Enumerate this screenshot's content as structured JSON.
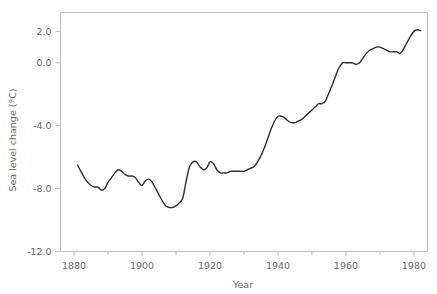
{
  "chart_data": {
    "type": "line",
    "title": "",
    "xlabel": "Year",
    "ylabel": "Sea level change (°C)",
    "xlim": [
      1876,
      1984
    ],
    "ylim": [
      -12.0,
      3.2
    ],
    "grid": false,
    "legend": null,
    "x_ticks": [
      1880,
      1900,
      1920,
      1940,
      1960,
      1980
    ],
    "x_tick_labels": [
      "1880",
      "1900",
      "1920",
      "1940",
      "1960",
      "1980"
    ],
    "x_minor_ticks": [
      1890,
      1910,
      1930,
      1950,
      1970
    ],
    "y_ticks": [
      2.0,
      0.0,
      -4.0,
      -8.0,
      -12.0
    ],
    "y_tick_labels": [
      "2.0",
      "0.0",
      "-4.0",
      "-8.0",
      "-12.0"
    ],
    "line_color": "#2e2e2e",
    "frame_color": "#bdbdbd",
    "series": [
      {
        "name": "Sea level change",
        "x": [
          1881,
          1882,
          1883,
          1884,
          1885,
          1886,
          1887,
          1888,
          1889,
          1890,
          1891,
          1892,
          1893,
          1894,
          1895,
          1896,
          1897,
          1898,
          1899,
          1900,
          1901,
          1902,
          1903,
          1904,
          1905,
          1906,
          1907,
          1908,
          1909,
          1910,
          1911,
          1912,
          1913,
          1914,
          1915,
          1916,
          1917,
          1918,
          1919,
          1920,
          1921,
          1922,
          1923,
          1924,
          1925,
          1926,
          1927,
          1928,
          1929,
          1930,
          1931,
          1932,
          1933,
          1934,
          1935,
          1936,
          1937,
          1938,
          1939,
          1940,
          1941,
          1942,
          1943,
          1944,
          1945,
          1946,
          1947,
          1948,
          1949,
          1950,
          1951,
          1952,
          1953,
          1954,
          1955,
          1956,
          1957,
          1958,
          1959,
          1960,
          1961,
          1962,
          1963,
          1964,
          1965,
          1966,
          1967,
          1968,
          1969,
          1970,
          1971,
          1972,
          1973,
          1974,
          1975,
          1976,
          1977,
          1978,
          1979,
          1980,
          1981,
          1982
        ],
        "y": [
          -6.5,
          -6.9,
          -7.3,
          -7.6,
          -7.8,
          -7.9,
          -7.9,
          -8.1,
          -8.0,
          -7.6,
          -7.3,
          -7.0,
          -6.8,
          -6.9,
          -7.1,
          -7.2,
          -7.2,
          -7.3,
          -7.6,
          -7.8,
          -7.5,
          -7.4,
          -7.6,
          -8.0,
          -8.4,
          -8.8,
          -9.1,
          -9.2,
          -9.2,
          -9.1,
          -8.9,
          -8.6,
          -7.5,
          -6.6,
          -6.3,
          -6.3,
          -6.6,
          -6.8,
          -6.7,
          -6.3,
          -6.4,
          -6.8,
          -7.0,
          -7.0,
          -7.0,
          -6.9,
          -6.9,
          -6.9,
          -6.9,
          -6.9,
          -6.8,
          -6.7,
          -6.6,
          -6.3,
          -5.9,
          -5.4,
          -4.8,
          -4.2,
          -3.7,
          -3.4,
          -3.4,
          -3.5,
          -3.7,
          -3.8,
          -3.8,
          -3.7,
          -3.6,
          -3.4,
          -3.2,
          -3.0,
          -2.8,
          -2.6,
          -2.6,
          -2.4,
          -1.9,
          -1.4,
          -0.8,
          -0.3,
          0.0,
          0.0,
          0.0,
          0.0,
          -0.1,
          0.0,
          0.3,
          0.6,
          0.8,
          0.9,
          1.0,
          1.0,
          0.9,
          0.8,
          0.7,
          0.7,
          0.7,
          0.6,
          0.9,
          1.3,
          1.7,
          2.0,
          2.1,
          2.05
        ]
      }
    ]
  }
}
